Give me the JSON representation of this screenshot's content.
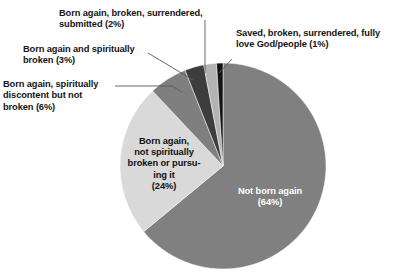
{
  "chart_data": {
    "type": "pie",
    "title": "",
    "subtitle": "",
    "xlabel": "",
    "ylabel": "",
    "legend_position": "none",
    "grid": false,
    "start_angle_deg": 0,
    "direction": "clockwise",
    "categories": [
      "Not born again",
      "Born again, not spiritually broken or pursuing it",
      "Born again, spiritually discontent but not broken",
      "Born again and spiritually broken",
      "Born again, broken, surrendered, submitted",
      "Saved, broken, surrendered, fully love God/people"
    ],
    "values": [
      64,
      24,
      6,
      3,
      2,
      1
    ],
    "units": "percent",
    "slices": [
      {
        "label": "Not born again",
        "value": 64,
        "value_text": "(64%)",
        "color": "#808080",
        "label_placement": "inside",
        "label_text": "Not born again\n(64%)"
      },
      {
        "label": "Born again, not spiritually broken or pursuing it",
        "value": 24,
        "value_text": "(24%)",
        "color": "#d9d9d9",
        "label_placement": "inside",
        "label_text": "Born again,\nnot spiritually\nbroken or pursu-\ning it\n(24%)"
      },
      {
        "label": "Born again, spiritually discontent but not broken",
        "value": 6,
        "value_text": "(6%)",
        "color": "#7f7f7f",
        "label_placement": "callout-left",
        "label_text": "Born again, spiritually\ndiscontent but not\nbroken (6%)"
      },
      {
        "label": "Born again and spiritually broken",
        "value": 3,
        "value_text": "(3%)",
        "color": "#3d3d3d",
        "label_placement": "callout-left",
        "label_text": "Born again and spiritually\nbroken (3%)"
      },
      {
        "label": "Born again, broken, surrendered, submitted",
        "value": 2,
        "value_text": "(2%)",
        "color": "#b3b3b3",
        "label_placement": "callout-top",
        "label_text": "Born again, broken, surrendered,\nsubmitted (2%)"
      },
      {
        "label": "Saved, broken, surrendered, fully love God/people",
        "value": 1,
        "value_text": "(1%)",
        "color": "#141414",
        "label_placement": "callout-right",
        "label_text": "Saved, broken, surrendered, fully\nlove God/people (1%)"
      }
    ]
  },
  "callouts": {
    "submitted": "Born again, broken, surrendered,\nsubmitted (2%)",
    "spiritually_broken": "Born again and spiritually\nbroken (3%)",
    "discontent": "Born again, spiritually\ndiscontent but not\nbroken (6%)",
    "saved": "Saved, broken, surrendered, fully\nlove God/people (1%)"
  },
  "inside_labels": {
    "born_again_not": "Born again,\nnot spiritually\nbroken or pursu-\ning it\n(24%)",
    "not_born_again": "Not born again\n(64%)"
  },
  "colors": {
    "background": "#ffffff",
    "text": "#141414",
    "inverse_text": "#ffffff",
    "leader_line": "#5a5a5a",
    "slice_not_born_again": "#808080",
    "slice_born_again_not_broken": "#d9d9d9",
    "slice_discontent": "#7f7f7f",
    "slice_spiritually_broken": "#3d3d3d",
    "slice_submitted": "#b3b3b3",
    "slice_saved": "#141414"
  },
  "geometry": {
    "center_x": 223,
    "center_y": 166,
    "radius": 103
  }
}
